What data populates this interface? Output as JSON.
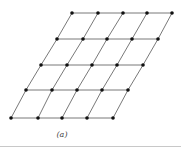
{
  "figure": {
    "caption": "(a)",
    "line_color": "#555555",
    "point_color": "#111111",
    "rows": [
      {
        "y": 13,
        "x": [
          72,
          98,
          123,
          147,
          172
        ]
      },
      {
        "y": 39,
        "x": [
          57,
          83,
          107,
          132,
          158
        ]
      },
      {
        "y": 65,
        "x": [
          41,
          67,
          92,
          117,
          143
        ]
      },
      {
        "y": 90,
        "x": [
          26,
          52,
          77,
          102,
          128
        ]
      },
      {
        "y": 118,
        "x": [
          11,
          38,
          62,
          87,
          113
        ]
      }
    ]
  }
}
